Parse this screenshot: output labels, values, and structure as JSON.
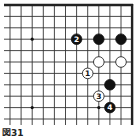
{
  "diagram": {
    "caption": "図31",
    "board": {
      "columns": 12,
      "rows": 11,
      "x0": 10,
      "dx": 11.1,
      "y0": 5,
      "dy": 11.4,
      "edges": [
        "top",
        "right"
      ],
      "line_color": "#333333",
      "edge_color": "#222222"
    },
    "star_points": [
      {
        "col": 2,
        "row": 3
      },
      {
        "col": 2,
        "row": 9
      },
      {
        "col": 8,
        "row": 9
      }
    ],
    "stones": [
      {
        "color": "black",
        "col": 6,
        "row": 3,
        "label": "2"
      },
      {
        "color": "black",
        "col": 8,
        "row": 3,
        "label": ""
      },
      {
        "color": "black",
        "col": 10,
        "row": 3,
        "label": ""
      },
      {
        "color": "white",
        "col": 8,
        "row": 5,
        "label": ""
      },
      {
        "color": "white",
        "col": 10,
        "row": 5,
        "label": ""
      },
      {
        "color": "white",
        "col": 7,
        "row": 6,
        "label": "1"
      },
      {
        "color": "black",
        "col": 9,
        "row": 7,
        "label": ""
      },
      {
        "color": "white",
        "col": 8,
        "row": 8,
        "label": "3"
      },
      {
        "color": "black",
        "col": 9,
        "row": 9,
        "label": "4"
      }
    ]
  }
}
